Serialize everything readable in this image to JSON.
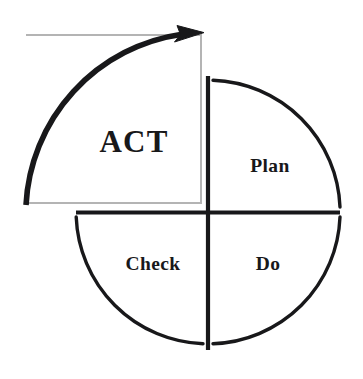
{
  "diagram": {
    "type": "pdca-cycle",
    "background_color": "#ffffff",
    "stroke_color": "#18181a",
    "guide_color": "#b4b4b4",
    "geometry": {
      "center_x": 208,
      "center_y": 212,
      "radius": 132,
      "arrow_radius": 182,
      "gap_degrees": 4
    },
    "quadrants": [
      {
        "key": "act",
        "label": "ACT",
        "position": "top-left",
        "label_x": 134,
        "label_y": 142,
        "emphasis": "primary"
      },
      {
        "key": "plan",
        "label": "Plan",
        "position": "top-right",
        "label_x": 270,
        "label_y": 166,
        "emphasis": "normal"
      },
      {
        "key": "do",
        "label": "Do",
        "position": "bottom-right",
        "label_x": 268,
        "label_y": 264,
        "emphasis": "normal"
      },
      {
        "key": "check",
        "label": "Check",
        "position": "bottom-left",
        "label_x": 153,
        "label_y": 264,
        "emphasis": "normal"
      }
    ],
    "arrow": {
      "name": "act-cycle-arrow",
      "direction": "clockwise",
      "start_angle": 180,
      "end_angle": 272,
      "stroke_width": 5.5,
      "head_length": 26,
      "head_width": 17
    },
    "guide_box": {
      "name": "act-guide-box",
      "x": 26,
      "y": 35,
      "width": 175,
      "height": 168,
      "stroke_width": 2
    }
  }
}
